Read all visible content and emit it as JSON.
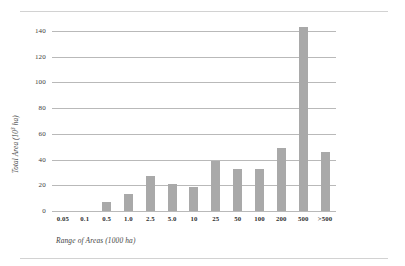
{
  "figure": {
    "y_axis_title_main": "Total Area (10",
    "y_axis_title_sup": "3",
    "y_axis_title_tail": " ha)",
    "x_axis_title": "Range of Areas (1000 ha)"
  },
  "chart_data": {
    "type": "bar",
    "title": "",
    "subtitle": "",
    "xlabel": "Range of Areas (1000 ha)",
    "ylabel": "Total Area (10³ ha)",
    "categories": [
      "0.05",
      "0.1",
      "0.5",
      "1.0",
      "2.5",
      "5.0",
      "10",
      "25",
      "50",
      "100",
      "200",
      "500",
      ">500"
    ],
    "values": [
      0,
      0,
      7,
      13.5,
      27.5,
      21,
      19,
      39,
      32.5,
      32.5,
      49,
      143,
      46
    ],
    "series": [
      {
        "name": "Total Area",
        "values": [
          0,
          0,
          7,
          13.5,
          27.5,
          21,
          19,
          39,
          32.5,
          32.5,
          49,
          143,
          46
        ]
      }
    ],
    "ylim": [
      0,
      140
    ],
    "yticks": [
      0,
      20,
      40,
      60,
      80,
      100,
      120,
      140
    ],
    "ytick_labels": [
      "0",
      "20",
      "40",
      "60",
      "80",
      "100",
      "120",
      "140"
    ],
    "grid": "horizontal",
    "legend": "none",
    "bar_color": "#a9a9a9",
    "gridline_color": "#b9b9b9"
  }
}
